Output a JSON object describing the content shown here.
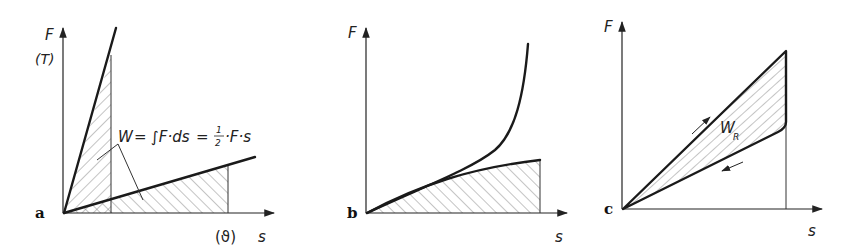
{
  "figure": {
    "panels": [
      {
        "id": "a",
        "letter": "a",
        "y_label": "F",
        "y_label_alt": "(T)",
        "x_label": "s",
        "x_label_alt": "(ϑ)",
        "formula": {
          "lhs": "W",
          "eq1": "=",
          "integral": "∫F·ds",
          "eq2": "=",
          "frac_num": "1",
          "frac_den": "2",
          "rhs": "·F·s"
        },
        "description": "Two linear F–s characteristics (stiff and soft spring); hatched triangular areas represent work W = ½·F·s"
      },
      {
        "id": "b",
        "letter": "b",
        "y_label": "F",
        "x_label": "s",
        "description": "Progressive (upper) and degressive (lower, hatched area) non-linear spring characteristics"
      },
      {
        "id": "c",
        "letter": "c",
        "y_label": "F",
        "x_label": "s",
        "area_label": "W",
        "area_label_sub": "R",
        "description": "Loading/unloading hysteresis loop; hatched area W_R is friction work"
      }
    ]
  },
  "colors": {
    "ink": "#1a1a1a",
    "background": "#ffffff"
  }
}
